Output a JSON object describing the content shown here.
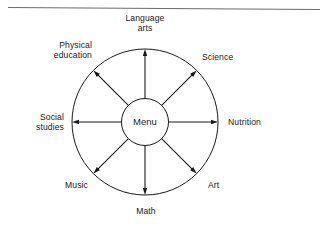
{
  "page": {
    "background_color": "#ffffff",
    "rule_color": "#6b6b6b",
    "ink_color": "#1a1a1a"
  },
  "diagram": {
    "type": "radial-web",
    "hub": {
      "label": "Menu"
    },
    "nodes": [
      {
        "id": "language-arts",
        "label": "Language\narts",
        "angle_deg": 270,
        "arrow": "outward"
      },
      {
        "id": "science",
        "label": "Science",
        "angle_deg": 315,
        "arrow": "outward"
      },
      {
        "id": "nutrition",
        "label": "Nutrition",
        "angle_deg": 0,
        "arrow": "outward"
      },
      {
        "id": "art",
        "label": "Art",
        "angle_deg": 45,
        "arrow": "outward"
      },
      {
        "id": "math",
        "label": "Math",
        "angle_deg": 90,
        "arrow": "outward"
      },
      {
        "id": "music",
        "label": "Music",
        "angle_deg": 135,
        "arrow": "outward"
      },
      {
        "id": "social-studies",
        "label": "Social\nstudies",
        "angle_deg": 180,
        "arrow": "outward"
      },
      {
        "id": "physical-education",
        "label": "Physical\neducation",
        "angle_deg": 225,
        "arrow": "outward"
      }
    ]
  },
  "chart_data": {
    "type": "diagram",
    "title": "",
    "center": "Menu",
    "categories": [
      "Language arts",
      "Science",
      "Nutrition",
      "Art",
      "Math",
      "Music",
      "Social studies",
      "Physical education"
    ],
    "relation": "radiates-from-center",
    "count": 8
  }
}
